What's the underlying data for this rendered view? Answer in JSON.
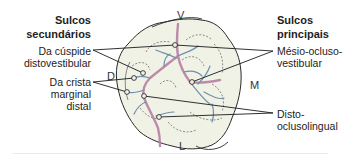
{
  "diagram": {
    "orientation_labels": {
      "top": "V",
      "bottom": "L",
      "left": "D",
      "right": "M"
    },
    "left_group": {
      "heading_line1": "Sulcos",
      "heading_line2": "secundários",
      "items": [
        {
          "line1": "Da cúspide",
          "line2": "distovestibular"
        },
        {
          "line1": "Da crista",
          "line2": "marginal",
          "line3": "distal"
        }
      ]
    },
    "right_group": {
      "heading_line1": "Sulcos",
      "heading_line2": "principais",
      "items": [
        {
          "line1": "Mésio-ocluso-",
          "line2": "vestibular"
        },
        {
          "line1": "Disto-",
          "line2": "oclusolingual"
        }
      ]
    },
    "colors": {
      "tooth_fill": "#f1f2e6",
      "outline": "#2a2a2a",
      "main_groove": "#b57aa0",
      "secondary_groove": "#6f8fae",
      "leader_line": "#1a1a1a",
      "bottom_rule": "#f4e6ea"
    }
  }
}
